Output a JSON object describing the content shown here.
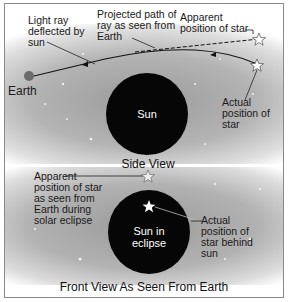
{
  "side_view": {
    "title": "Side View",
    "sun_label": "Sun",
    "earth_label": "Earth",
    "labels": {
      "light_ray": "Light ray\ndeflected by\nsun",
      "projected_path": "Projected path of\nray as seen from\nEarth",
      "apparent_position": "Apparent\nposition of star",
      "actual_position": "Actual\nposition of\nstar"
    }
  },
  "front_view": {
    "title": "Front View As Seen From Earth",
    "sun_label": "Sun in\neclipse",
    "labels": {
      "apparent_position": "Apparent\nposition of star\nas seen from\nEarth during\nsolar eclipse",
      "actual_position": "Actual\nposition of\nstar behind\nsun"
    }
  },
  "colors": {
    "sun": "#060606",
    "earth": "#6b6b6b",
    "background_gray": "#a8a8a8",
    "frame_border": "#8a8a8a"
  },
  "icons": [
    "star-outline-icon",
    "star-filled-icon",
    "earth-icon",
    "sun-disc"
  ]
}
